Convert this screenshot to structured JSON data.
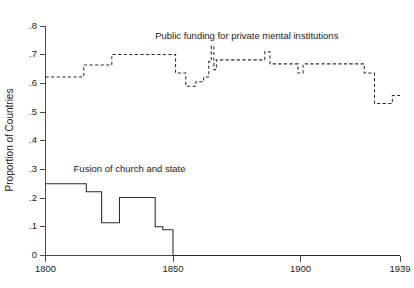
{
  "chart_data": {
    "type": "line",
    "title": "",
    "xlabel": "",
    "ylabel": "Proportion of Countries",
    "xlim": [
      1800,
      1939
    ],
    "ylim": [
      0,
      0.8
    ],
    "grid": false,
    "legend_position": "inline-annotations",
    "xticks": [
      1800,
      1850,
      1900,
      1939
    ],
    "xtick_labels": [
      "1800",
      "1850",
      "1900",
      "1939"
    ],
    "yticks": [
      0,
      0.1,
      0.2,
      0.3,
      0.4,
      0.5,
      0.6,
      0.7,
      0.8
    ],
    "ytick_labels": [
      "0",
      ".1",
      ".2",
      ".3",
      ".4",
      ".5",
      ".6",
      ".7",
      ".8"
    ],
    "series": [
      {
        "name": "Public funding for private mental institutions",
        "style": "dashed",
        "annotation": "Public funding for private mental institutions",
        "annotation_x": 1843,
        "annotation_y": 0.756,
        "x": [
          1800,
          1815,
          1815,
          1826,
          1826,
          1843,
          1843,
          1851,
          1851,
          1855,
          1855,
          1859,
          1859,
          1862,
          1862,
          1864,
          1864,
          1865,
          1865,
          1866,
          1866,
          1867,
          1867,
          1886,
          1886,
          1888,
          1888,
          1889,
          1889,
          1899,
          1899,
          1901,
          1901,
          1905,
          1905,
          1925,
          1925,
          1929,
          1929,
          1936,
          1936,
          1939
        ],
        "y": [
          0.622,
          0.622,
          0.664,
          0.664,
          0.701,
          0.701,
          0.701,
          0.701,
          0.636,
          0.636,
          0.59,
          0.59,
          0.606,
          0.606,
          0.622,
          0.622,
          0.676,
          0.676,
          0.73,
          0.73,
          0.648,
          0.648,
          0.682,
          0.682,
          0.71,
          0.71,
          0.668,
          0.668,
          0.668,
          0.668,
          0.636,
          0.636,
          0.668,
          0.668,
          0.668,
          0.668,
          0.636,
          0.636,
          0.53,
          0.53,
          0.558,
          0.558
        ]
      },
      {
        "name": "Fusion of church and state",
        "style": "solid",
        "annotation": "Fusion of church and state",
        "annotation_x": 1811,
        "annotation_y": 0.292,
        "x": [
          1800,
          1816,
          1816,
          1822,
          1822,
          1829,
          1829,
          1843,
          1843,
          1846,
          1846,
          1850,
          1850,
          1939
        ],
        "y": [
          0.25,
          0.25,
          0.222,
          0.222,
          0.114,
          0.114,
          0.202,
          0.202,
          0.1,
          0.1,
          0.09,
          0.09,
          0.0,
          0.0
        ]
      }
    ]
  }
}
